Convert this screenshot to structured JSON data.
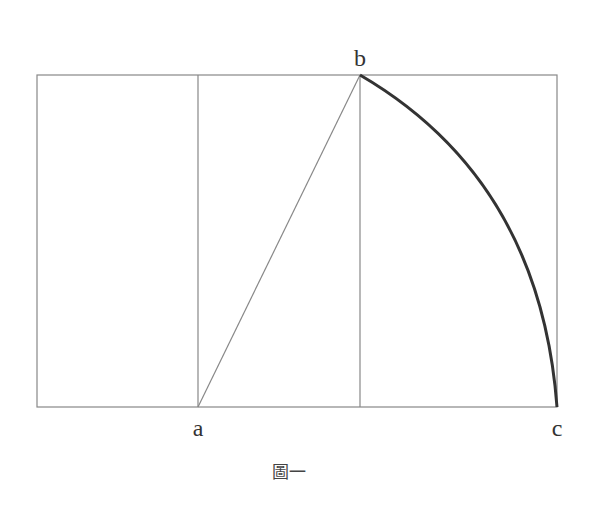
{
  "diagram": {
    "caption": "圖一",
    "labels": {
      "a": "a",
      "b": "b",
      "c": "c"
    },
    "colors": {
      "thin_line": "#888888",
      "arc": "#333333",
      "text": "#333333"
    },
    "geometry": {
      "outer_rect": {
        "x1": 37,
        "y1": 75,
        "x2": 557,
        "y2": 407
      },
      "vertical_lines_x": [
        198,
        360
      ],
      "point_a": [
        198,
        407
      ],
      "point_b": [
        360,
        75
      ],
      "point_c": [
        557,
        407
      ]
    }
  }
}
